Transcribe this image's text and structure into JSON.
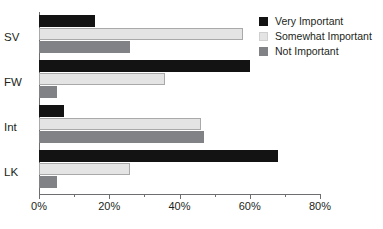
{
  "chart_data": {
    "type": "bar",
    "orientation": "horizontal",
    "title": "",
    "xlabel": "",
    "ylabel": "",
    "categories": [
      "SV",
      "FW",
      "Int",
      "LK"
    ],
    "series": [
      {
        "name": "Very Important",
        "color": "#131313",
        "values": [
          16,
          60,
          7,
          68
        ]
      },
      {
        "name": "Somewhat Important",
        "color": "#e4e4e4",
        "values": [
          58,
          36,
          46,
          26
        ]
      },
      {
        "name": "Not Important",
        "color": "#808285",
        "values": [
          26,
          5,
          47,
          5
        ]
      }
    ],
    "xlim": [
      0,
      80
    ],
    "xticks": [
      0,
      20,
      40,
      60,
      80
    ],
    "xtick_labels": [
      "0%",
      "20%",
      "40%",
      "60%",
      "80%"
    ],
    "minor_xticks": [
      10,
      30,
      50,
      70
    ],
    "grid": false,
    "legend_position": "top-right"
  },
  "axis": {
    "line_color": "#6d6e71"
  }
}
